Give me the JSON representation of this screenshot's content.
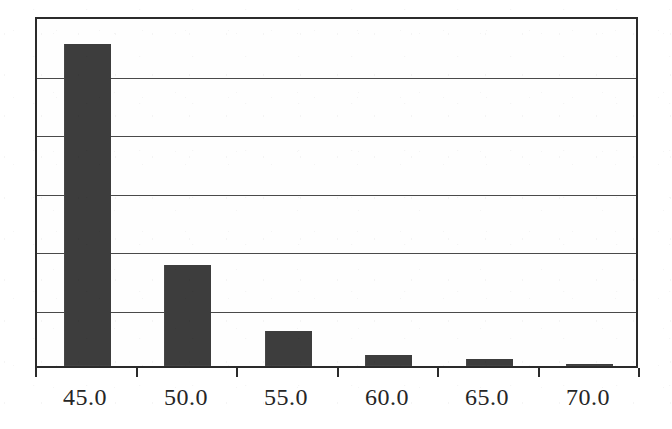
{
  "figure": {
    "background_color": "#ffffff",
    "bar_color": "#3d3d3d",
    "axis_color": "#2b2b2b",
    "grid_color": "#4a4a4a"
  },
  "chart_data": {
    "type": "bar",
    "title": "",
    "subtitle": "",
    "xlabel": "",
    "ylabel": "",
    "categories": [
      "45.0",
      "50.0",
      "55.0",
      "60.0",
      "65.0",
      "70.0"
    ],
    "tick_labels": [
      "45.0",
      "50.0",
      "55.0",
      "60.0",
      "65.0",
      "70.0"
    ],
    "values": [
      5.5,
      1.73,
      0.6,
      0.19,
      0.12,
      0.04
    ],
    "ylim": [
      0,
      6
    ],
    "yticks": [
      0,
      1,
      2,
      3,
      4,
      5,
      6
    ],
    "ytick_labels": [],
    "grid": true,
    "grid_axis": "y",
    "legend": false,
    "legend_position": "none",
    "annotations": []
  }
}
